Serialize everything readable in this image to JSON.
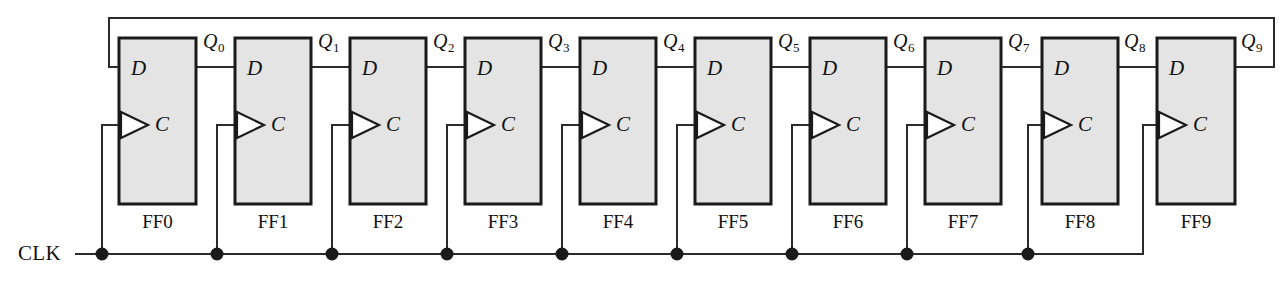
{
  "diagram": {
    "clock_label": "CLK",
    "input_label": "D",
    "clock_input_label": "C",
    "colors": {
      "box_fill": "#e4e4e4",
      "box_stroke": "#1a1a1a",
      "wire": "#2b2b2b",
      "text": "#111111",
      "background": "#ffffff"
    },
    "stages": [
      {
        "name": "FF0",
        "d_label": "D",
        "c_label": "C",
        "q_label": "Q",
        "q_subscript": "0"
      },
      {
        "name": "FF1",
        "d_label": "D",
        "c_label": "C",
        "q_label": "Q",
        "q_subscript": "1"
      },
      {
        "name": "FF2",
        "d_label": "D",
        "c_label": "C",
        "q_label": "Q",
        "q_subscript": "2"
      },
      {
        "name": "FF3",
        "d_label": "D",
        "c_label": "C",
        "q_label": "Q",
        "q_subscript": "3"
      },
      {
        "name": "FF4",
        "d_label": "D",
        "c_label": "C",
        "q_label": "Q",
        "q_subscript": "4"
      },
      {
        "name": "FF5",
        "d_label": "D",
        "c_label": "C",
        "q_label": "Q",
        "q_subscript": "5"
      },
      {
        "name": "FF6",
        "d_label": "D",
        "c_label": "C",
        "q_label": "Q",
        "q_subscript": "6"
      },
      {
        "name": "FF7",
        "d_label": "D",
        "c_label": "C",
        "q_label": "Q",
        "q_subscript": "7"
      },
      {
        "name": "FF8",
        "d_label": "D",
        "c_label": "C",
        "q_label": "Q",
        "q_subscript": "8"
      },
      {
        "name": "FF9",
        "d_label": "D",
        "c_label": "C",
        "q_label": "Q",
        "q_subscript": "9"
      }
    ]
  }
}
